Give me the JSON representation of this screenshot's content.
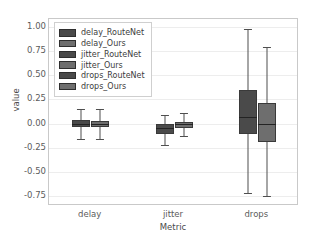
{
  "chart_data": {
    "type": "box",
    "title": "",
    "xlabel": "Metric",
    "ylabel": "value",
    "categories": [
      "delay",
      "jitter",
      "drops"
    ],
    "yticks": [
      "1.00",
      "0.75",
      "0.50",
      "0.25",
      "0.00",
      "-0.25",
      "-0.50",
      "-0.75"
    ],
    "ytick_values": [
      1.0,
      0.75,
      0.5,
      0.25,
      0.0,
      -0.25,
      -0.5,
      -0.75
    ],
    "ylim": [
      -0.85,
      1.08
    ],
    "grid": "horizontal",
    "legend_position": "upper-left",
    "series": [
      {
        "name": "delay_RouteNet",
        "color": "#4a4a4a",
        "category": "delay",
        "whisker_low": -0.155,
        "q1": -0.035,
        "median": 0.0,
        "q3": 0.035,
        "whisker_high": 0.15
      },
      {
        "name": "delay_Ours",
        "color": "#6e6e6e",
        "category": "delay",
        "whisker_low": -0.155,
        "q1": -0.03,
        "median": 0.0,
        "q3": 0.03,
        "whisker_high": 0.155
      },
      {
        "name": "jitter_RouteNet",
        "color": "#4a4a4a",
        "category": "jitter",
        "whisker_low": -0.22,
        "q1": -0.105,
        "median": -0.05,
        "q3": -0.005,
        "whisker_high": 0.09
      },
      {
        "name": "jitter_Ours",
        "color": "#6e6e6e",
        "category": "jitter",
        "whisker_low": -0.125,
        "q1": -0.04,
        "median": -0.005,
        "q3": 0.015,
        "whisker_high": 0.115
      },
      {
        "name": "drops_RouteNet",
        "color": "#4a4a4a",
        "category": "drops",
        "whisker_low": -0.72,
        "q1": -0.105,
        "median": 0.07,
        "q3": 0.345,
        "whisker_high": 0.98
      },
      {
        "name": "drops_Ours",
        "color": "#6e6e6e",
        "category": "drops",
        "whisker_low": -0.75,
        "q1": -0.19,
        "median": 0.0,
        "q3": 0.21,
        "whisker_high": 0.79
      }
    ],
    "legend": [
      {
        "label": "delay_RouteNet",
        "color": "#4a4a4a"
      },
      {
        "label": "delay_Ours",
        "color": "#6e6e6e"
      },
      {
        "label": "jitter_RouteNet",
        "color": "#4a4a4a"
      },
      {
        "label": "jitter_Ours",
        "color": "#6e6e6e"
      },
      {
        "label": "drops_RouteNet",
        "color": "#4a4a4a"
      },
      {
        "label": "drops_Ours",
        "color": "#6e6e6e"
      }
    ]
  }
}
